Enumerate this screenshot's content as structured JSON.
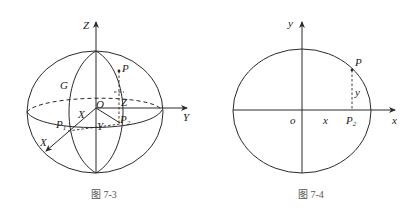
{
  "figures": [
    {
      "caption": "图 7-3",
      "labels": {
        "z_axis": "Z",
        "y_axis": "Y",
        "x_axis": "X",
        "origin": "O",
        "point_p": "P",
        "point_g": "G",
        "p1_main": "P",
        "p1_sub": "1",
        "p2_main": "P",
        "p2_sub": "2",
        "seg_x": "X",
        "seg_y": "Y",
        "seg_z": "Z"
      }
    },
    {
      "caption": "图 7-4",
      "labels": {
        "y_axis": "y",
        "x_axis": "x",
        "origin": "o",
        "point_p": "P",
        "seg_x": "x",
        "seg_y": "y",
        "p2_main": "P",
        "p2_sub": "2"
      }
    }
  ]
}
